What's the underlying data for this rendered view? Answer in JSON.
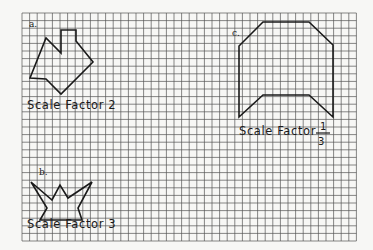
{
  "grid": {
    "x0": 22,
    "y0": 13,
    "cols": 44,
    "rows": 30,
    "cell": 7.6,
    "line_color": "#555555",
    "background": "#f7f7f5"
  },
  "figures": [
    {
      "id": "a",
      "label": "a.",
      "caption": "Scale Factor 2",
      "points": "61,30 76,30 76,41 93,62 61,94 46,79 30,78 46,38 61,53 61,30"
    },
    {
      "id": "b",
      "label": "b.",
      "caption": "Scale Factor 3",
      "points": "31,182 52,200 60,185 68,198 92,182 78,208 82,220 40,220 47,208 31,182"
    },
    {
      "id": "c",
      "label": "c.",
      "caption": "Scale Factor",
      "fraction": {
        "numerator": "1",
        "denominator": "3"
      },
      "points": "263,22 309,22 333,45 333,117 309,95 263,95 239,117 239,46 263,22"
    }
  ]
}
